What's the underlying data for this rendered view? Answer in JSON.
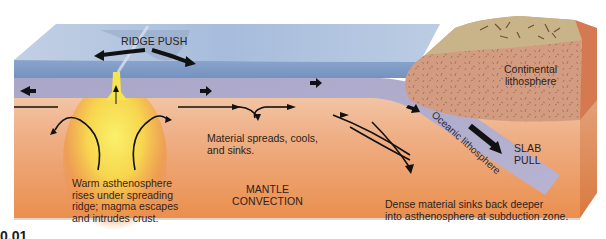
{
  "labels": {
    "ridge_push": "RIDGE PUSH",
    "continental_lithosphere_1": "Continental",
    "continental_lithosphere_2": "lithosphere",
    "oceanic_lithosphere": "Oceanic lithosphere",
    "slab_pull_1": "SLAB",
    "slab_pull_2": "PULL",
    "material_spreads_1": "Material spreads, cools,",
    "material_spreads_2": "and sinks.",
    "mantle_convection_1": "MANTLE",
    "mantle_convection_2": "CONVECTION",
    "warm_asthenosphere_1": "Warm asthenosphere",
    "warm_asthenosphere_2": "rises under spreading",
    "warm_asthenosphere_3": "ridge; magma escapes",
    "warm_asthenosphere_4": "and intrudes crust.",
    "dense_material_1": "Dense material sinks back deeper",
    "dense_material_2": "into asthenosphere at subduction zone.",
    "figure_number": "0.01"
  },
  "colors": {
    "ocean_top": "#9fb6d6",
    "ocean_side": "#7f9cc4",
    "lithosphere": "#a9a6c6",
    "asthenosphere": "#e9955c",
    "magma": "#f6e45a",
    "continent": "#d59a7c",
    "text": "#2a2320"
  }
}
